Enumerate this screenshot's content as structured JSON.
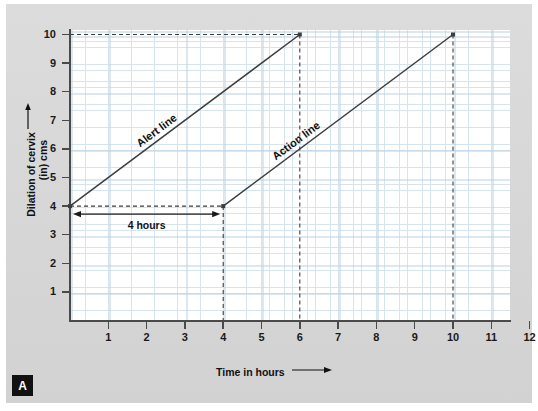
{
  "figure": {
    "panel_letter": "A",
    "background_color": "#d9d9d9",
    "plot_background_color": "#ffffff"
  },
  "chart_data": {
    "type": "line",
    "title": "",
    "subtitle": "",
    "xlabel": "Time in hours →",
    "ylabel": "Dilation of cervix → (in) cms",
    "xlabel_text": "Time in hours",
    "ylabel_line1": "Dilation of cervix",
    "ylabel_line2": "(in) cms",
    "xlim": [
      0,
      12.6
    ],
    "ylim": [
      0,
      10.5
    ],
    "xticks": [
      1,
      2,
      3,
      4,
      5,
      6,
      7,
      8,
      9,
      10,
      11,
      12
    ],
    "yticks": [
      1,
      2,
      3,
      4,
      5,
      6,
      7,
      8,
      9,
      10
    ],
    "xtick_labels": [
      "1",
      "2",
      "3",
      "4",
      "5",
      "6",
      "7",
      "8",
      "9",
      "10",
      "11",
      "12"
    ],
    "ytick_labels": [
      "1",
      "2",
      "3",
      "4",
      "5",
      "6",
      "7",
      "8",
      "9",
      "10"
    ],
    "grid": true,
    "grid_minor": true,
    "grid_major_color": "#b9cfe0",
    "grid_minor_color": "#d6e4ef",
    "legend": "inline-labels",
    "line_color": "#3d3d3d",
    "series": [
      {
        "name": "Alert line",
        "label": "Alert line",
        "points": [
          [
            0,
            4
          ],
          [
            6,
            10
          ]
        ],
        "slope_cm_per_hour": 1,
        "style": "solid",
        "endpoint_marker": true
      },
      {
        "name": "Action line",
        "label": "Action line",
        "points": [
          [
            4,
            4
          ],
          [
            10,
            10
          ]
        ],
        "slope_cm_per_hour": 1,
        "style": "solid",
        "endpoint_marker": true
      }
    ],
    "annotations": [
      {
        "name": "four-hours-span",
        "text": "4 hours",
        "type": "double-arrow",
        "from": [
          0,
          4
        ],
        "to": [
          4,
          4
        ]
      },
      {
        "name": "alert-top-guide",
        "text": "",
        "type": "dashed-horizontal",
        "from": [
          0,
          10
        ],
        "to": [
          6,
          10
        ]
      },
      {
        "name": "alert-end-guide",
        "text": "",
        "type": "dashed-vertical",
        "from": [
          6,
          10
        ],
        "to": [
          6,
          0
        ]
      },
      {
        "name": "action-start-guide",
        "text": "",
        "type": "dashed-vertical",
        "from": [
          4,
          4
        ],
        "to": [
          4,
          0
        ]
      },
      {
        "name": "action-end-guide",
        "text": "",
        "type": "dashed-vertical",
        "from": [
          10,
          10
        ],
        "to": [
          10,
          0
        ]
      },
      {
        "name": "baseline-guide",
        "text": "",
        "type": "dashed-horizontal",
        "from": [
          0,
          4
        ],
        "to": [
          4,
          4
        ]
      }
    ]
  }
}
